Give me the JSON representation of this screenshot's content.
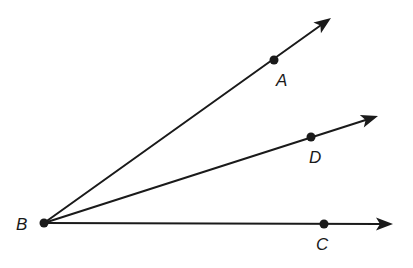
{
  "diagram": {
    "type": "geometry-rays",
    "colors": {
      "stroke": "#1a1a1a",
      "background": "#ffffff"
    },
    "vertex": {
      "name": "B",
      "x": 44,
      "y": 223,
      "label": "B",
      "label_x": 16,
      "label_y": 230
    },
    "rays": [
      {
        "name": "BA",
        "point": {
          "label": "A",
          "x": 274,
          "y": 60,
          "label_x": 276,
          "label_y": 86
        },
        "tip": {
          "x": 331,
          "y": 18
        }
      },
      {
        "name": "BD",
        "point": {
          "label": "D",
          "x": 311,
          "y": 137,
          "label_x": 309,
          "label_y": 163
        },
        "tip": {
          "x": 378,
          "y": 116
        }
      },
      {
        "name": "BC",
        "point": {
          "label": "C",
          "x": 324,
          "y": 224,
          "label_x": 316,
          "label_y": 250
        },
        "tip": {
          "x": 393,
          "y": 224
        }
      }
    ]
  }
}
